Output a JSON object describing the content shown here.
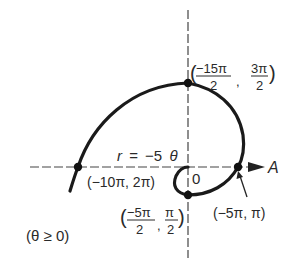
{
  "diagram": {
    "equation": {
      "lhs": "r",
      "eq": "=",
      "coef": "−5",
      "var": "θ"
    },
    "condition": "(θ ≥ 0)",
    "polar_axis_label": "A",
    "origin_label": "0",
    "points": [
      {
        "id": "top",
        "label_num1": "−15π",
        "label_den1": "2",
        "label_num2": "3π",
        "label_den2": "2"
      },
      {
        "id": "left",
        "label": "(−10π, 2π)"
      },
      {
        "id": "right",
        "label": "(−5π, π)"
      },
      {
        "id": "bottom",
        "label_num1": "−5π",
        "label_den1": "2",
        "label_num2": "π",
        "label_den2": "2"
      }
    ],
    "colors": {
      "curve": "#1a1a1a",
      "axis": "#333333",
      "text": "#2a2a2a"
    }
  }
}
